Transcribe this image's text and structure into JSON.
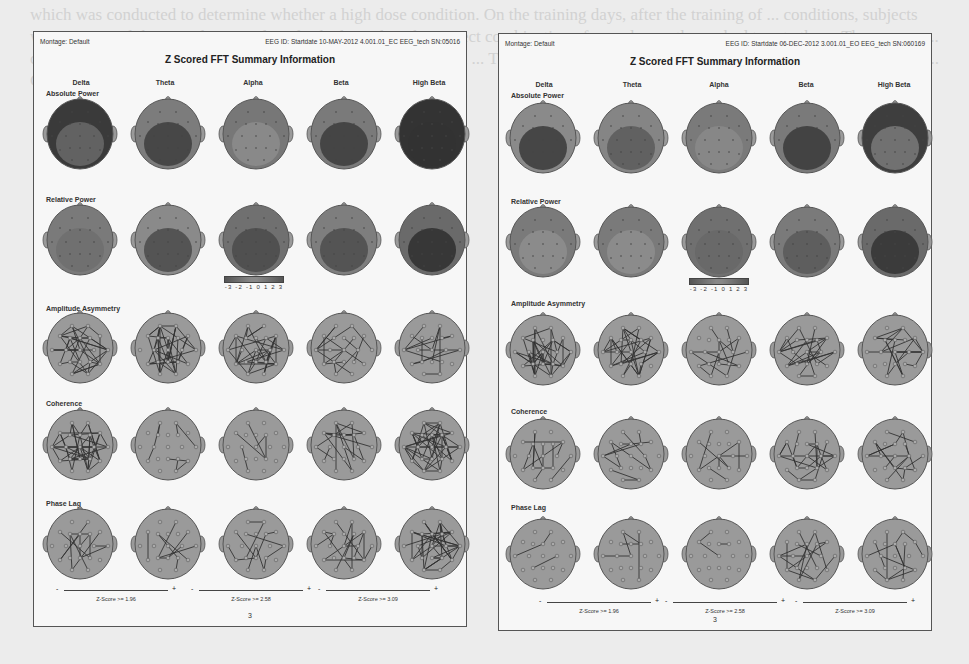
{
  "background_text": "which was conducted to determine whether a high dose condition. On the training days, after the training of ... conditions, subjects were presented the 36 video stimuli and asked to select the correct combination of ... and were then asked to rate the ... The ... were ... counterbalanced ... combinations. Thus, two sets of ... were ... in ... The extent of the ... effects for each participant ... by ... The two ... Gamma ... Summary ... Generalization ... NAT",
  "panels": [
    {
      "id": "left",
      "montage": "Montage:  Default",
      "eeg_id": "EEG ID:  Startdate 10-MAY-2012 4.001.01_EC EEG_tech SN:05016",
      "title": "Z Scored FFT Summary Information",
      "bands": [
        "Delta",
        "Theta",
        "Alpha",
        "Beta",
        "High Beta"
      ],
      "rows": [
        {
          "label": "Absolute Power",
          "type": "map",
          "shades": [
            [
              "#3a3a3a",
              "#6a6a6a"
            ],
            [
              "#7c7c7c",
              "#3e3e3e"
            ],
            [
              "#777777",
              "#8c8c8c"
            ],
            [
              "#7a7a7a",
              "#3c3c3c"
            ],
            [
              "#333333",
              "#333333"
            ]
          ]
        },
        {
          "label": "Relative Power",
          "type": "map",
          "shades": [
            [
              "#7a7a7a",
              "#6e6e6e"
            ],
            [
              "#8a8a8a",
              "#4a4a4a"
            ],
            [
              "#707070",
              "#4a4a4a"
            ],
            [
              "#7e7e7e",
              "#4c4c4c"
            ],
            [
              "#6a6a6a",
              "#2e2e2e"
            ]
          ]
        },
        {
          "label": "Amplitude Asymmetry",
          "type": "net",
          "density": [
            40,
            40,
            34,
            18,
            16
          ]
        },
        {
          "label": "Coherence",
          "type": "net",
          "density": [
            44,
            8,
            5,
            18,
            44
          ]
        },
        {
          "label": "Phase Lag",
          "type": "net",
          "density": [
            12,
            10,
            12,
            16,
            42
          ]
        }
      ],
      "colorbar": {
        "ticks": "-3 -2 -1 0 1 2 3"
      },
      "zscore_legend": [
        "Z-Score >= 1.96",
        "Z-Score >= 2.58",
        "Z-Score >= 3.09"
      ],
      "page_number": "3"
    },
    {
      "id": "right",
      "montage": "Montage:  Default",
      "eeg_id": "EEG ID:  Startdate 06-DEC-2012 3.001.01_EO EEG_tech SN:060169",
      "title": "Z Scored FFT Summary Information",
      "bands": [
        "Delta",
        "Theta",
        "Alpha",
        "Beta",
        "High Beta"
      ],
      "rows": [
        {
          "label": "Absolute Power",
          "type": "map",
          "shades": [
            [
              "#8a8a8a",
              "#3a3a3a"
            ],
            [
              "#858585",
              "#5a5a5a"
            ],
            [
              "#7a7a7a",
              "#8a8a8a"
            ],
            [
              "#7a7a7a",
              "#3a3a3a"
            ],
            [
              "#3e3e3e",
              "#7a7a7a"
            ]
          ]
        },
        {
          "label": "Relative Power",
          "type": "map",
          "shades": [
            [
              "#7a7a7a",
              "#8e8e8e"
            ],
            [
              "#7a7a7a",
              "#8e8e8e"
            ],
            [
              "#707070",
              "#676767"
            ],
            [
              "#7a7a7a",
              "#595959"
            ],
            [
              "#6a6a6a",
              "#333333"
            ]
          ]
        },
        {
          "label": "Amplitude Asymmetry",
          "type": "net",
          "density": [
            40,
            32,
            16,
            26,
            20
          ]
        },
        {
          "label": "Coherence",
          "type": "net",
          "density": [
            12,
            12,
            8,
            22,
            16
          ]
        },
        {
          "label": "Phase Lag",
          "type": "net",
          "density": [
            4,
            5,
            3,
            16,
            14
          ]
        }
      ],
      "colorbar": {
        "ticks": "-3 -2 -1 0 1 2 3"
      },
      "zscore_legend": [
        "Z-Score >= 1.96",
        "Z-Score >= 2.58",
        "Z-Score >= 3.09"
      ],
      "page_number": "3"
    }
  ]
}
